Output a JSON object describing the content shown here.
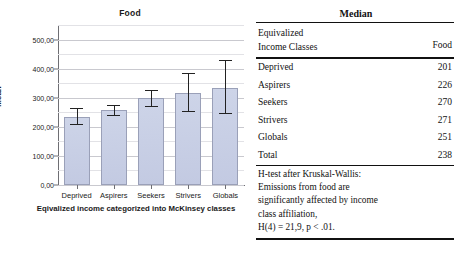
{
  "chart_data": {
    "type": "bar",
    "title": "Food",
    "xlabel": "Eqivalized income categorized into McKinsey classes",
    "ylabel": "Mean",
    "categories": [
      "Deprived",
      "Aspirers",
      "Seekers",
      "Strivers",
      "Globals"
    ],
    "values": [
      235,
      257,
      298,
      318,
      335
    ],
    "error_low": [
      210,
      240,
      272,
      255,
      248
    ],
    "error_high": [
      263,
      275,
      325,
      385,
      430
    ],
    "ylim": [
      0,
      550
    ],
    "yticks": [
      0,
      100,
      200,
      300,
      400,
      500
    ],
    "ytick_labels": [
      "0,00",
      "100,00",
      "200,00",
      "300,00",
      "400,00",
      "500,00"
    ],
    "grid": true,
    "legend": "none",
    "error_bar_type": "95% CI",
    "bar_color": "#c6cde4",
    "bar_border_color": "#9aa0b8"
  },
  "table": {
    "top_header": "Median",
    "col_header_left_line1": "Equivalized",
    "col_header_left_line2": "Income Classes",
    "col_header_right": "Food",
    "rows": [
      {
        "label": "Deprived",
        "value": "201"
      },
      {
        "label": "Aspirers",
        "value": "226"
      },
      {
        "label": "Seekers",
        "value": "270"
      },
      {
        "label": "Strivers",
        "value": "271"
      },
      {
        "label": "Globals",
        "value": "251"
      },
      {
        "label": "Total",
        "value": "238"
      }
    ],
    "note_lines": [
      "H-test after Kruskal-Wallis:",
      "Emissions from food are",
      "significantly affected by income",
      "class affiliation,",
      "H(4) = 21,9, p < .01."
    ]
  }
}
